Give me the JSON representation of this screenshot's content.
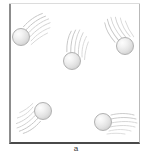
{
  "figure": {
    "width": 153,
    "height": 153,
    "background_color": "#ffffff"
  },
  "container": {
    "label": "container-box",
    "x": 9,
    "y": 3,
    "width": 131,
    "height": 141,
    "fill_color": "#ffffff",
    "border_left_color": "#8c8c8c",
    "border_right_color": "#b9b9b9",
    "border_top_color": "#e8e8e8",
    "border_bottom_color": "#4a4a4a"
  },
  "particles": [
    {
      "id": "particle-1",
      "label": "upper-left particle",
      "cx": 21,
      "cy": 37,
      "radius": 9,
      "fill_color": "#e4e4e4",
      "outline_color": "#b0b0b0",
      "trail_direction": "up-right",
      "trail_angle_deg": 35,
      "trail_color": "#c6c6c6"
    },
    {
      "id": "particle-2",
      "label": "upper-middle particle",
      "cx": 72,
      "cy": 61,
      "radius": 9,
      "fill_color": "#e4e4e4",
      "outline_color": "#b0b0b0",
      "trail_direction": "up",
      "trail_angle_deg": 78,
      "trail_color": "#c6c6c6"
    },
    {
      "id": "particle-3",
      "label": "upper-right particle",
      "cx": 125,
      "cy": 46,
      "radius": 9,
      "fill_color": "#e4e4e4",
      "outline_color": "#b0b0b0",
      "trail_direction": "up-left",
      "trail_angle_deg": 118,
      "trail_color": "#c6c6c6"
    },
    {
      "id": "particle-4",
      "label": "lower-left particle",
      "cx": 43,
      "cy": 111,
      "radius": 9,
      "fill_color": "#e4e4e4",
      "outline_color": "#b0b0b0",
      "trail_direction": "down-left",
      "trail_angle_deg": 215,
      "trail_color": "#c6c6c6"
    },
    {
      "id": "particle-5",
      "label": "lower-right particle",
      "cx": 103,
      "cy": 122,
      "radius": 9,
      "fill_color": "#e4e4e4",
      "outline_color": "#b0b0b0",
      "trail_direction": "right",
      "trail_angle_deg": 0,
      "trail_color": "#c6c6c6"
    }
  ],
  "caption": {
    "mark": "a",
    "visible": true
  }
}
